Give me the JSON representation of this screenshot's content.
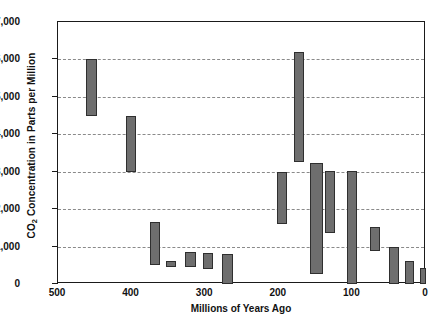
{
  "chart_data": {
    "type": "bar",
    "title": "",
    "xlabel": "Millions of Years Ago",
    "ylabel": "CO2 Concentration in Parts per Million",
    "ylabel_prefix": "CO",
    "ylabel_sub": "2",
    "ylabel_suffix": " Concentration in Parts per Million",
    "xlim": [
      500,
      0
    ],
    "ylim": [
      0,
      7000
    ],
    "x_reversed": true,
    "grid": "horizontal-dashed",
    "legend": "none",
    "y_ticks": [
      0,
      1000,
      2000,
      3000,
      4000,
      5000,
      6000,
      7000
    ],
    "y_tick_labels": [
      "0",
      "1,000",
      "2,000",
      "3,000",
      "4,000",
      "5,000",
      "6,000",
      "7,000"
    ],
    "x_ticks": [
      500,
      400,
      300,
      200,
      100,
      0
    ],
    "x_tick_labels": [
      "500",
      "400",
      "300",
      "200",
      "100",
      "0"
    ],
    "bar_color": "#6e6e6e",
    "bar_edge_color": "#2f2f2f",
    "note": "Floating range bars: each bar spans a minimum to maximum CO2 estimate over a time interval.",
    "bars": [
      {
        "x_start": 462,
        "x_end": 447,
        "y_low": 4500,
        "y_high": 6000
      },
      {
        "x_start": 408,
        "x_end": 394,
        "y_low": 3000,
        "y_high": 4500
      },
      {
        "x_start": 375,
        "x_end": 361,
        "y_low": 500,
        "y_high": 1650
      },
      {
        "x_start": 353,
        "x_end": 340,
        "y_low": 450,
        "y_high": 620
      },
      {
        "x_start": 327,
        "x_end": 313,
        "y_low": 450,
        "y_high": 850
      },
      {
        "x_start": 303,
        "x_end": 289,
        "y_low": 400,
        "y_high": 840
      },
      {
        "x_start": 277,
        "x_end": 262,
        "y_low": 0,
        "y_high": 790
      },
      {
        "x_start": 203,
        "x_end": 189,
        "y_low": 1600,
        "y_high": 3000
      },
      {
        "x_start": 180,
        "x_end": 166,
        "y_low": 3250,
        "y_high": 6200
      },
      {
        "x_start": 158,
        "x_end": 140,
        "y_low": 280,
        "y_high": 3220
      },
      {
        "x_start": 137,
        "x_end": 123,
        "y_low": 1350,
        "y_high": 3020
      },
      {
        "x_start": 108,
        "x_end": 94,
        "y_low": 0,
        "y_high": 3020
      },
      {
        "x_start": 76,
        "x_end": 62,
        "y_low": 880,
        "y_high": 1520
      },
      {
        "x_start": 50,
        "x_end": 37,
        "y_low": 0,
        "y_high": 980
      },
      {
        "x_start": 28,
        "x_end": 16,
        "y_low": 0,
        "y_high": 620
      },
      {
        "x_start": 8,
        "x_end": 0,
        "y_low": 0,
        "y_high": 440
      }
    ]
  }
}
